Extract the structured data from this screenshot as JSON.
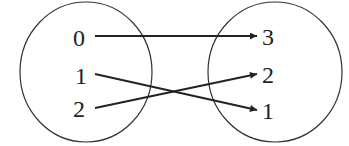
{
  "diagram": {
    "type": "function-mapping",
    "domain_set": {
      "elements": [
        "0",
        "1",
        "2"
      ]
    },
    "codomain_set": {
      "elements": [
        "3",
        "2",
        "1"
      ]
    },
    "mappings": [
      {
        "from": "0",
        "to": "3"
      },
      {
        "from": "1",
        "to": "1"
      },
      {
        "from": "2",
        "to": "2"
      }
    ],
    "colors": {
      "stroke": "#222222",
      "background": "#ffffff"
    }
  }
}
